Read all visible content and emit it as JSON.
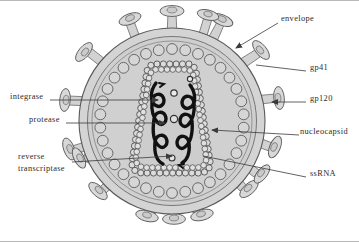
{
  "figure": {
    "background_color": "#ffffff",
    "border_color": "#b9b9b9",
    "line_color": "#555555",
    "fill_light": "#d9d9d9",
    "fill_mid": "#cfcfcf",
    "fill_dark": "#bdbdbd",
    "rna_color": "#101010"
  },
  "labels": [
    {
      "id": "envelope",
      "text": "envelope",
      "side": "right",
      "x": 281,
      "y": 17,
      "leader": {
        "type": "arrow",
        "x1": 278,
        "y1": 22,
        "x2": 236,
        "y2": 47
      }
    },
    {
      "id": "gp41",
      "text": "gp41",
      "side": "right",
      "x": 310,
      "y": 66,
      "leader": {
        "type": "line",
        "x1": 306,
        "y1": 70,
        "x2": 256,
        "y2": 64
      }
    },
    {
      "id": "gp120",
      "text": "gp120",
      "side": "right",
      "x": 310,
      "y": 97,
      "leader": {
        "type": "arrow",
        "x1": 306,
        "y1": 101,
        "x2": 272,
        "y2": 101
      }
    },
    {
      "id": "nucleocapsid",
      "text": "nucleocapsid",
      "side": "right",
      "x": 302,
      "y": 130,
      "leader": {
        "type": "arrow",
        "x1": 299,
        "y1": 134,
        "x2": 212,
        "y2": 129
      }
    },
    {
      "id": "ssRNA",
      "text": "ssRNA",
      "side": "right",
      "x": 310,
      "y": 172,
      "leader": {
        "type": "line",
        "x1": 306,
        "y1": 176,
        "x2": 203,
        "y2": 155
      }
    },
    {
      "id": "integrase",
      "text": "integrase",
      "side": "left",
      "x": 10,
      "y": 95,
      "leader": {
        "type": "arrow",
        "x1": 50,
        "y1": 99,
        "x2": 158,
        "y2": 99
      }
    },
    {
      "id": "protease",
      "text": "protease",
      "side": "left",
      "x": 29,
      "y": 118,
      "leader": {
        "type": "arrow",
        "x1": 66,
        "y1": 122,
        "x2": 165,
        "y2": 122
      }
    },
    {
      "id": "reverse-transcriptase",
      "text": "reverse transcriptase",
      "line1": "reverse",
      "line2": "transcriptase",
      "side": "left",
      "x": 18,
      "y": 156,
      "leader": {
        "type": "arrow",
        "x1": 72,
        "y1": 161,
        "x2": 172,
        "y2": 155
      }
    }
  ],
  "structures": {
    "envelope": {
      "cx": 172,
      "cy": 120,
      "r": 93,
      "label": "envelope"
    },
    "envelope_inner": {
      "cx": 172,
      "cy": 120,
      "r": 84
    },
    "matrix_ring": {
      "cx": 172,
      "cy": 120,
      "r": 72,
      "bead_count": 34,
      "bead_r": 5.4
    },
    "core": {
      "shape": "truncated-cone",
      "bead_count": 52,
      "bead_r": 3.1
    },
    "spikes": {
      "count": 17,
      "stalk": "gp41",
      "knob": "gp120"
    },
    "rna_strands": 2,
    "enzyme_dots": 3
  }
}
